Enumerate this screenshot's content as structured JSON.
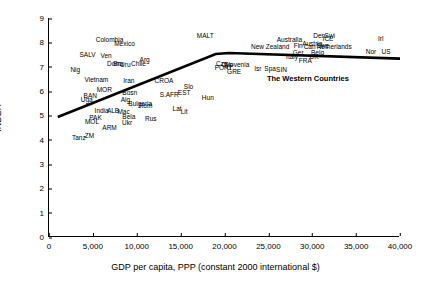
{
  "chart_data": {
    "type": "scatter",
    "title": "",
    "xlabel": "GDP per capita, PPP (constant 2000 international $)",
    "ylabel": "INDEX",
    "xlim": [
      0,
      40000
    ],
    "ylim": [
      0,
      9
    ],
    "xticks": [
      "0",
      "5,000",
      "10,000",
      "15,000",
      "20,000",
      "25,000",
      "30,000",
      "35,000",
      "40,000"
    ],
    "xtick_values": [
      0,
      5000,
      10000,
      15000,
      20000,
      25000,
      30000,
      35000,
      40000
    ],
    "yticks": [
      "0",
      "1",
      "2",
      "3",
      "4",
      "5",
      "6",
      "7",
      "8",
      "9"
    ],
    "ytick_values": [
      0,
      1,
      2,
      3,
      4,
      5,
      6,
      7,
      8,
      9
    ],
    "grid": false,
    "legend": "none",
    "annotations": [
      {
        "text": "The Western Countries",
        "x": 29500,
        "y": 6.55
      }
    ],
    "trendline": {
      "description": "fitted curve rising from left then flattening at right",
      "points": [
        {
          "x": 1000,
          "y": 4.93
        },
        {
          "x": 19000,
          "y": 7.52
        },
        {
          "x": 20500,
          "y": 7.56
        },
        {
          "x": 40000,
          "y": 7.33
        }
      ]
    },
    "points": [
      {
        "label": "Colombia",
        "x": 6900,
        "y": 8.1
      },
      {
        "label": "Mexico",
        "x": 8600,
        "y": 7.93
      },
      {
        "label": "MALT",
        "x": 17800,
        "y": 8.25
      },
      {
        "label": "Australia",
        "x": 27400,
        "y": 8.1
      },
      {
        "label": "Den",
        "x": 30800,
        "y": 8.28
      },
      {
        "label": "Swi",
        "x": 32000,
        "y": 8.28
      },
      {
        "label": "ICE",
        "x": 31800,
        "y": 8.13
      },
      {
        "label": "Irl",
        "x": 37800,
        "y": 8.13
      },
      {
        "label": "Austria",
        "x": 30000,
        "y": 7.95
      },
      {
        "label": "Swe",
        "x": 31200,
        "y": 7.83
      },
      {
        "label": "Netherlands",
        "x": 32500,
        "y": 7.8
      },
      {
        "label": "New Zealand",
        "x": 25200,
        "y": 7.8
      },
      {
        "label": "Fin",
        "x": 28400,
        "y": 7.83
      },
      {
        "label": "Can",
        "x": 29700,
        "y": 7.8
      },
      {
        "label": "Nor",
        "x": 36700,
        "y": 7.62
      },
      {
        "label": "US",
        "x": 38400,
        "y": 7.62
      },
      {
        "label": "Ger",
        "x": 28400,
        "y": 7.58
      },
      {
        "label": "SALV",
        "x": 4400,
        "y": 7.48
      },
      {
        "label": "Ven",
        "x": 6500,
        "y": 7.45
      },
      {
        "label": "Belg",
        "x": 30600,
        "y": 7.55
      },
      {
        "label": "UK",
        "x": 30200,
        "y": 7.4
      },
      {
        "label": "Italy",
        "x": 27700,
        "y": 7.38
      },
      {
        "label": "FRA",
        "x": 29200,
        "y": 7.25
      },
      {
        "label": "Arg",
        "x": 10900,
        "y": 7.28
      },
      {
        "label": "Dom",
        "x": 7400,
        "y": 7.1
      },
      {
        "label": "Bra",
        "x": 7900,
        "y": 7.1
      },
      {
        "label": "Uru",
        "x": 8700,
        "y": 7.05
      },
      {
        "label": "Chile",
        "x": 10200,
        "y": 7.12
      },
      {
        "label": "Cze",
        "x": 19700,
        "y": 7.1
      },
      {
        "label": "Cyp",
        "x": 20300,
        "y": 7.05
      },
      {
        "label": "PORT",
        "x": 19900,
        "y": 6.95
      },
      {
        "label": "Slovenia",
        "x": 21400,
        "y": 7.05
      },
      {
        "label": "Nig",
        "x": 3000,
        "y": 6.88
      },
      {
        "label": "Isr",
        "x": 23800,
        "y": 6.9
      },
      {
        "label": "Spa",
        "x": 25200,
        "y": 6.9
      },
      {
        "label": "SIN",
        "x": 26500,
        "y": 6.88
      },
      {
        "label": "GRE",
        "x": 21100,
        "y": 6.78
      },
      {
        "label": "Vietnam",
        "x": 5400,
        "y": 6.45
      },
      {
        "label": "Iran",
        "x": 9100,
        "y": 6.42
      },
      {
        "label": "CROA",
        "x": 13100,
        "y": 6.4
      },
      {
        "label": "Slo",
        "x": 15900,
        "y": 6.18
      },
      {
        "label": "MOR",
        "x": 6300,
        "y": 6.05
      },
      {
        "label": "EST",
        "x": 15400,
        "y": 5.93
      },
      {
        "label": "Bosn",
        "x": 9200,
        "y": 5.9
      },
      {
        "label": "S.AFR",
        "x": 13700,
        "y": 5.85
      },
      {
        "label": "BAN",
        "x": 4700,
        "y": 5.78
      },
      {
        "label": "Uga",
        "x": 4300,
        "y": 5.65
      },
      {
        "label": "Hun",
        "x": 18100,
        "y": 5.72
      },
      {
        "label": "Alg",
        "x": 8700,
        "y": 5.62
      },
      {
        "label": "Bulgaria",
        "x": 10400,
        "y": 5.48
      },
      {
        "label": "Rom",
        "x": 11000,
        "y": 5.38
      },
      {
        "label": "India",
        "x": 6000,
        "y": 5.18
      },
      {
        "label": "ALB",
        "x": 7300,
        "y": 5.18
      },
      {
        "label": "Mac",
        "x": 8500,
        "y": 5.15
      },
      {
        "label": "Lat",
        "x": 14600,
        "y": 5.25
      },
      {
        "label": "Lit",
        "x": 15400,
        "y": 5.12
      },
      {
        "label": "PAK",
        "x": 5300,
        "y": 4.9
      },
      {
        "label": "Bela",
        "x": 9100,
        "y": 4.92
      },
      {
        "label": "Rus",
        "x": 11600,
        "y": 4.85
      },
      {
        "label": "MOL",
        "x": 4900,
        "y": 4.72
      },
      {
        "label": "Ukr",
        "x": 8900,
        "y": 4.7
      },
      {
        "label": "ARM",
        "x": 6900,
        "y": 4.48
      },
      {
        "label": "Tanz",
        "x": 3400,
        "y": 4.08
      },
      {
        "label": "ZM",
        "x": 4600,
        "y": 4.15
      }
    ]
  }
}
